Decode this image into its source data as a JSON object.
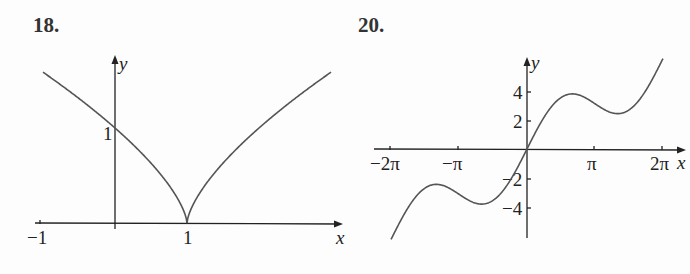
{
  "chart_data": [
    {
      "type": "line",
      "label": "18.",
      "function_hint": "y = |x - 1|^(2/3)",
      "xlabel": "x",
      "ylabel": "y",
      "x_ticks": [
        {
          "value": -1,
          "label": "−1"
        },
        {
          "value": 1,
          "label": "1"
        }
      ],
      "y_ticks": [
        {
          "value": 1,
          "label": "1"
        }
      ],
      "xlim": [
        -1,
        3
      ],
      "ylim": [
        0,
        1.6
      ],
      "grid": false,
      "series": [
        {
          "name": "curve",
          "x": [
            -1,
            -0.5,
            0,
            0.5,
            0.8,
            0.95,
            1,
            1.05,
            1.2,
            1.5,
            2,
            2.5,
            3
          ],
          "values": [
            1.587,
            1.31,
            1.0,
            0.63,
            0.342,
            0.136,
            0,
            0.136,
            0.342,
            0.63,
            1.0,
            1.31,
            1.587
          ]
        }
      ]
    },
    {
      "type": "line",
      "label": "20.",
      "function_hint": "y = x + 2 sin x",
      "xlabel": "x",
      "ylabel": "y",
      "x_ticks": [
        {
          "value": -6.2832,
          "label": "−2π"
        },
        {
          "value": -3.1416,
          "label": "−π"
        },
        {
          "value": 3.1416,
          "label": "π"
        },
        {
          "value": 6.2832,
          "label": "2π"
        }
      ],
      "y_ticks": [
        {
          "value": 4,
          "label": "4"
        },
        {
          "value": 2,
          "label": "2"
        },
        {
          "value": -2,
          "label": "−2"
        },
        {
          "value": -4,
          "label": "−4"
        }
      ],
      "xlim": [
        -6.2832,
        6.2832
      ],
      "ylim": [
        -6.3,
        6.3
      ],
      "grid": false,
      "series": [
        {
          "name": "curve",
          "x": [
            -6.2832,
            -5.236,
            -4.189,
            -3.1416,
            -2.094,
            -1.047,
            0,
            1.047,
            2.094,
            3.1416,
            4.189,
            5.236,
            6.2832
          ],
          "values": [
            -6.283,
            -4.236,
            -2.457,
            -3.142,
            -3.826,
            -2.779,
            0,
            2.779,
            3.826,
            3.142,
            2.457,
            4.236,
            6.283
          ]
        }
      ]
    }
  ]
}
